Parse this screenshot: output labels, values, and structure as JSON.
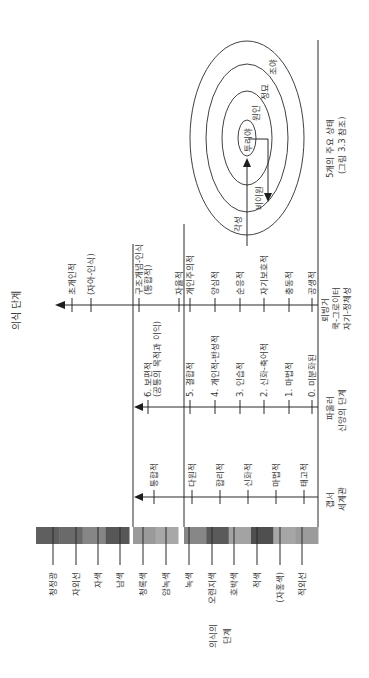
{
  "title": "의식 단계",
  "color_band": {
    "label": [
      "의식의",
      "단계"
    ],
    "colors": [
      {
        "name": "청정광",
        "hex": "#5f5f5f"
      },
      {
        "name": "자외선",
        "hex": "#6a6a6a"
      },
      {
        "name": "자색",
        "hex": "#868686"
      },
      {
        "name": "남색",
        "hex": "#575757"
      },
      {
        "name": "청록색",
        "hex": "#9a9a9a"
      },
      {
        "name": "암녹색",
        "hex": "#a8a8a8"
      },
      {
        "name": "녹색",
        "hex": "#878787"
      },
      {
        "name": "오렌지색",
        "hex": "#5a5a5a"
      },
      {
        "name": "호박색",
        "hex": "#a3a3a3"
      },
      {
        "name": "적색",
        "hex": "#4f4f4f"
      },
      {
        "name": "(자홍색)",
        "hex": "#a6a6a6"
      },
      {
        "name": "적외선",
        "hex": "#9b9b9b"
      }
    ]
  },
  "columns": [
    {
      "id": "gebser",
      "header": [
        "갭서",
        "세계관"
      ],
      "stages": [
        "태고적",
        "마법적",
        "신화적",
        "합리적",
        "다원적",
        "통합적"
      ]
    },
    {
      "id": "fowler",
      "header": [
        "파울러",
        "신앙의 단계"
      ],
      "stages": [
        "0. 미분화된",
        "1. 마법적",
        "2. 신화-축어적",
        "3. 인습적",
        "4. 개인적-반성적",
        "5. 결합적",
        "6. 보편적",
        "(공통의 목적과 이익)"
      ]
    },
    {
      "id": "loevinger",
      "header": [
        "뢰빙거",
        "쿡-그로이터",
        "자기-정체성"
      ],
      "stages": [
        "공생적",
        "충동적",
        "자기보호적",
        "순응적",
        "양심적",
        "개인주의적",
        "자율적",
        "구조개념-인식",
        "(통합적)",
        "(자아-인식)",
        "초개인적"
      ]
    },
    {
      "id": "states",
      "header": [
        "5개의 주요 상태",
        "(그림 3.3 참조)"
      ],
      "rings": [
        "각성",
        "비이원",
        "꿈",
        "원인",
        "정묘",
        "조야",
        "투리야"
      ],
      "ring_labels": [
        "각성",
        "비이원",
        "원인",
        "정묘",
        "조야",
        "투리야"
      ]
    }
  ]
}
